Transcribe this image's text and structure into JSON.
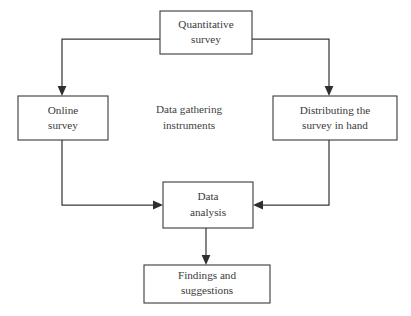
{
  "diagram": {
    "title": "Data gathering instruments",
    "background_color": "#ffffff",
    "line_color": "#3a3a3a",
    "text_color": "#3a3a3a",
    "nodes": {
      "quantitative_survey": {
        "line1": "Quantitative",
        "line2": "survey"
      },
      "online_survey": {
        "line1": "Online",
        "line2": "survey"
      },
      "distributing_survey": {
        "line1": "Distributing the",
        "line2": "survey in hand"
      },
      "center_label": {
        "line1": "Data gathering",
        "line2": "instruments"
      },
      "data_analysis": {
        "line1": "Data",
        "line2": "analysis"
      },
      "findings_suggestions": {
        "line1": "Findings and",
        "line2": "suggestions"
      }
    }
  }
}
